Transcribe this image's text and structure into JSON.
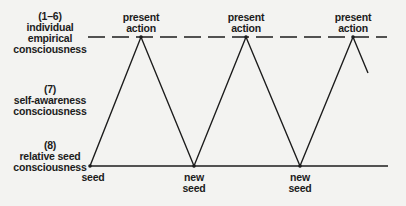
{
  "levels": [
    {
      "number": "(1–6)",
      "line1": "individual",
      "line2": "empirical",
      "line3": "consciousness"
    },
    {
      "number": "(7)",
      "line1": "self-awareness",
      "line2": "consciousness"
    },
    {
      "number": "(8)",
      "line1": "relative seed",
      "line2": "consciousness"
    }
  ],
  "peaks": [
    {
      "line1": "present",
      "line2": "action"
    },
    {
      "line1": "present",
      "line2": "action"
    },
    {
      "line1": "present",
      "line2": "action"
    }
  ],
  "seeds": [
    {
      "line1": "seed"
    },
    {
      "line1": "new",
      "line2": "seed"
    },
    {
      "line1": "new",
      "line2": "seed"
    }
  ],
  "colors": {
    "line": "#1c1c1c",
    "background": "#f3f3f1"
  }
}
